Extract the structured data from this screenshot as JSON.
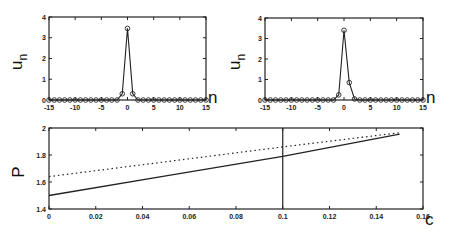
{
  "chart_data": [
    {
      "type": "line",
      "panel": "top-left",
      "xlabel": "n",
      "ylabel": "u_n",
      "xlim": [
        -15,
        15
      ],
      "ylim": [
        0,
        4
      ],
      "xticks": [
        "-15",
        "-10",
        "-5",
        "0",
        "5",
        "10",
        "15"
      ],
      "yticks": [
        "0",
        "1",
        "2",
        "3",
        "4"
      ],
      "marker": "circle",
      "x": [
        -15,
        -14,
        -13,
        -12,
        -11,
        -10,
        -9,
        -8,
        -7,
        -6,
        -5,
        -4,
        -3,
        -2,
        -1,
        0,
        1,
        2,
        3,
        4,
        5,
        6,
        7,
        8,
        9,
        10,
        11,
        12,
        13,
        14,
        15
      ],
      "values": [
        0,
        0,
        0,
        0,
        0,
        0,
        0,
        0,
        0,
        0,
        0,
        0,
        0,
        0,
        0.3,
        3.45,
        0.3,
        0,
        0,
        0,
        0,
        0,
        0,
        0,
        0,
        0,
        0,
        0,
        0,
        0,
        0
      ]
    },
    {
      "type": "line",
      "panel": "top-right",
      "xlabel": "n",
      "ylabel": "u_n",
      "xlim": [
        -15,
        15
      ],
      "ylim": [
        0,
        4
      ],
      "xticks": [
        "-15",
        "-10",
        "-5",
        "0",
        "5",
        "10",
        "15"
      ],
      "yticks": [
        "0",
        "1",
        "2",
        "3",
        "4"
      ],
      "marker": "circle",
      "x": [
        -15,
        -14,
        -13,
        -12,
        -11,
        -10,
        -9,
        -8,
        -7,
        -6,
        -5,
        -4,
        -3,
        -2,
        -1,
        0,
        1,
        2,
        3,
        4,
        5,
        6,
        7,
        8,
        9,
        10,
        11,
        12,
        13,
        14,
        15
      ],
      "values": [
        0,
        0,
        0,
        0,
        0,
        0,
        0,
        0,
        0,
        0,
        0,
        0,
        0,
        0,
        0.25,
        3.4,
        0.85,
        0.05,
        0,
        0,
        0,
        0,
        0,
        0,
        0,
        0,
        0,
        0,
        0,
        0,
        0
      ]
    },
    {
      "type": "line",
      "panel": "bottom",
      "xlabel": "c",
      "ylabel": "P",
      "xlim": [
        0,
        0.16
      ],
      "ylim": [
        1.4,
        2
      ],
      "xticks": [
        "0",
        "0.02",
        "0.04",
        "0.06",
        "0.08",
        "0.1",
        "0.12",
        "0.14",
        "0.16"
      ],
      "yticks": [
        "1.4",
        "1.6",
        "1.8",
        "2"
      ],
      "vline_x": 0.1,
      "series": [
        {
          "name": "solid",
          "style": "solid",
          "x": [
            0,
            0.05,
            0.1,
            0.15
          ],
          "values": [
            1.5,
            1.645,
            1.79,
            1.955
          ]
        },
        {
          "name": "dotted",
          "style": "dotted",
          "x": [
            0,
            0.05,
            0.1,
            0.15
          ],
          "values": [
            1.64,
            1.75,
            1.86,
            1.965
          ]
        }
      ]
    }
  ]
}
